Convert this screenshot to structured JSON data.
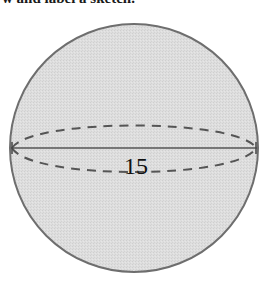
{
  "caption": {
    "text": "w and label a sketch."
  },
  "figure": {
    "shape": "sphere",
    "fill_color": "#dcdcdc",
    "outline_color": "#6e6e6e",
    "line_color": "#555555",
    "dash_color": "#555555",
    "diameter_label": "15"
  }
}
